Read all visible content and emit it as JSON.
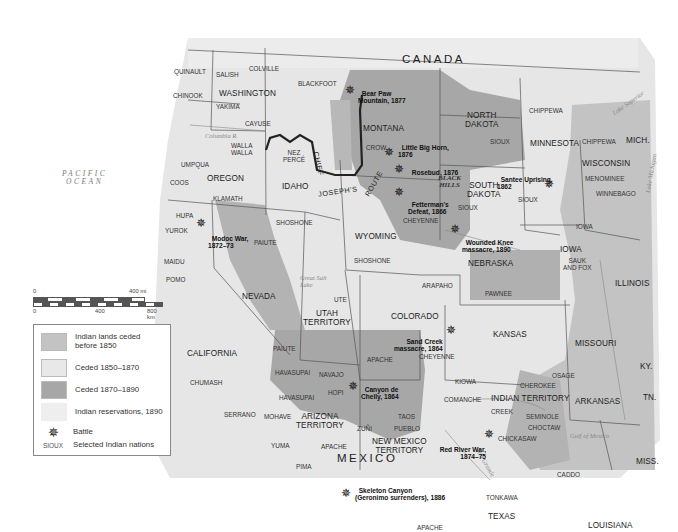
{
  "colors": {
    "ceded_before_1850": "#c3c3c3",
    "ceded_1850_1870": "#e3e3e3",
    "ceded_1870_1890": "#a7a7a7",
    "reservations_1890": "#ededed",
    "background_land": "#e6e6e6",
    "water": "#ffffff",
    "border": "#555555",
    "route": "#222222"
  },
  "countries": {
    "canada": "CANADA",
    "mexico": "MEXICO"
  },
  "water_bodies": {
    "pacific": "PACIFIC\nOCEAN",
    "gulf": "Gulf of Mexico",
    "lake_superior": "Lake Superior",
    "lake_michigan": "Lake Michigan",
    "great_salt_lake": "Great Salt Lake",
    "columbia": "Columbia R.",
    "missouri": "Missouri R.",
    "minnesota_r": "Minnesota R.",
    "platte": "Platte R.",
    "colorado_r": "Colorado R.",
    "arkansas_r": "Arkansas R.",
    "red_r": "Red R.",
    "rio_grande": "Rio Grande",
    "mississippi": "Mississippi R.",
    "snake": "Snake R."
  },
  "states": {
    "washington": "WASHINGTON",
    "oregon": "OREGON",
    "idaho": "IDAHO",
    "montana": "MONTANA",
    "north_dakota": "NORTH\nDAKOTA",
    "south_dakota": "SOUTH\nDAKOTA",
    "minnesota": "MINNESOTA",
    "wisconsin": "WISCONSIN",
    "mich": "MICH.",
    "wyoming": "WYOMING",
    "nebraska": "NEBRASKA",
    "iowa": "IOWA",
    "illinois": "ILLINOIS",
    "nevada": "NEVADA",
    "utah": "UTAH\nTERRITORY",
    "colorado": "COLORADO",
    "kansas": "KANSAS",
    "missouri": "MISSOURI",
    "california": "CALIFORNIA",
    "arizona": "ARIZONA\nTERRITORY",
    "new_mexico": "NEW MEXICO\nTERRITORY",
    "indian_territory": "INDIAN TERRITORY",
    "arkansas": "ARKANSAS",
    "texas": "TEXAS",
    "louisiana": "LOUISIANA",
    "miss": "MISS.",
    "ky": "KY.",
    "tn": "TN."
  },
  "nations": [
    {
      "id": "quinault",
      "label": "QUINAULT"
    },
    {
      "id": "salish",
      "label": "SALISH"
    },
    {
      "id": "colville",
      "label": "COLVILLE"
    },
    {
      "id": "chinook",
      "label": "CHINOOK"
    },
    {
      "id": "yakima",
      "label": "YAKIMA"
    },
    {
      "id": "cayuse",
      "label": "CAYUSE"
    },
    {
      "id": "blackfoot",
      "label": "BLACKFOOT"
    },
    {
      "id": "walla_walla",
      "label": "WALLA\nWALLA"
    },
    {
      "id": "nez_perce",
      "label": "NEZ\nPERCÉ"
    },
    {
      "id": "umpqua",
      "label": "UMPQUA"
    },
    {
      "id": "coos",
      "label": "COOS"
    },
    {
      "id": "klamath",
      "label": "KLAMATH"
    },
    {
      "id": "hupa",
      "label": "HUPA"
    },
    {
      "id": "yurok",
      "label": "YUROK"
    },
    {
      "id": "maidu",
      "label": "MAIDU"
    },
    {
      "id": "pomo",
      "label": "POMO"
    },
    {
      "id": "shoshone_id",
      "label": "SHOSHONE"
    },
    {
      "id": "paiute_n",
      "label": "PAIUTE"
    },
    {
      "id": "crow",
      "label": "CROW"
    },
    {
      "id": "sioux_nd",
      "label": "SIOUX"
    },
    {
      "id": "chippewa_mn",
      "label": "CHIPPEWA"
    },
    {
      "id": "chippewa_wi",
      "label": "CHIPPEWA"
    },
    {
      "id": "menominee",
      "label": "MENOMINEE"
    },
    {
      "id": "winnebago",
      "label": "WINNEBAGO"
    },
    {
      "id": "sioux_sd",
      "label": "SIOUX"
    },
    {
      "id": "sioux_mn",
      "label": "SIOUX"
    },
    {
      "id": "cheyenne_n",
      "label": "CHEYENNE"
    },
    {
      "id": "shoshone_wy",
      "label": "SHOSHONE"
    },
    {
      "id": "iowa_n",
      "label": "IOWA"
    },
    {
      "id": "sauk_fox",
      "label": "SAUK\nAND FOX"
    },
    {
      "id": "ute",
      "label": "UTE"
    },
    {
      "id": "arapaho",
      "label": "ARAPAHO"
    },
    {
      "id": "pawnee",
      "label": "PAWNEE"
    },
    {
      "id": "paiute_s",
      "label": "PAIUTE"
    },
    {
      "id": "apache_co",
      "label": "APACHE"
    },
    {
      "id": "cheyenne_s",
      "label": "CHEYENNE"
    },
    {
      "id": "chumash",
      "label": "CHUMASH"
    },
    {
      "id": "havasupai1",
      "label": "HAVASUPAI"
    },
    {
      "id": "havasupai2",
      "label": "HAVASUPAI"
    },
    {
      "id": "navajo",
      "label": "NAVAJO"
    },
    {
      "id": "hopi",
      "label": "HOPI"
    },
    {
      "id": "kiowa",
      "label": "KIOWA"
    },
    {
      "id": "osage",
      "label": "OSAGE"
    },
    {
      "id": "cherokee",
      "label": "CHEROKEE"
    },
    {
      "id": "comanche",
      "label": "COMANCHE"
    },
    {
      "id": "creek",
      "label": "CREEK"
    },
    {
      "id": "seminole",
      "label": "SEMINOLE"
    },
    {
      "id": "choctaw",
      "label": "CHOCTAW"
    },
    {
      "id": "chickasaw",
      "label": "CHICKASAW"
    },
    {
      "id": "serrano",
      "label": "SERRANO"
    },
    {
      "id": "mohave",
      "label": "MOHAVE"
    },
    {
      "id": "taos",
      "label": "TAOS"
    },
    {
      "id": "pueblo",
      "label": "PUEBLO"
    },
    {
      "id": "zuni",
      "label": "ZUÑI"
    },
    {
      "id": "yuma",
      "label": "YUMA"
    },
    {
      "id": "apache_az",
      "label": "APACHE"
    },
    {
      "id": "pima",
      "label": "PIMA"
    },
    {
      "id": "caddo",
      "label": "CADDO"
    },
    {
      "id": "tonkawa",
      "label": "TONKAWA"
    },
    {
      "id": "apache_tx",
      "label": "APACHE"
    }
  ],
  "battles": [
    {
      "id": "bear_paw",
      "label": "Bear Paw\nMountain, 1877"
    },
    {
      "id": "little_big_horn",
      "label": "Little Big Horn,\n1876"
    },
    {
      "id": "rosebud",
      "label": "Rosebud, 1876"
    },
    {
      "id": "fetterman",
      "label": "Fetterman's\nDefeat, 1866"
    },
    {
      "id": "santee",
      "label": "Santee Uprising,\n1862"
    },
    {
      "id": "wounded_knee",
      "label": "Wounded Knee\nmassacre, 1890"
    },
    {
      "id": "modoc",
      "label": "Modoc War,\n1872–73"
    },
    {
      "id": "sand_creek",
      "label": "Sand Creek\nmassacre, 1864"
    },
    {
      "id": "canyon_de_chelly",
      "label": "Canyon de\nChelly, 1864"
    },
    {
      "id": "red_river",
      "label": "Red River War,\n1874–75"
    },
    {
      "id": "skeleton_canyon",
      "label": "Skeleton Canyon\n(Geronimo surrenders), 1886"
    }
  ],
  "route": {
    "label_1": "CHIEF",
    "label_2": "JOSEPH'S",
    "label_3": "ROUTE"
  },
  "black_hills": "BLACK\nHILLS",
  "scale": {
    "mi_0": "0",
    "mi_400": "400 mi",
    "km_0": "0",
    "km_400": "400",
    "km_800": "800 km"
  },
  "legend": {
    "items": [
      {
        "label": "Indian lands ceded\nbefore 1850",
        "type": "swatch",
        "color_key": "ceded_before_1850"
      },
      {
        "label": "Ceded 1850–1870",
        "type": "swatch",
        "color_key": "ceded_1850_1870"
      },
      {
        "label": "Ceded 1870–1890",
        "type": "swatch",
        "color_key": "ceded_1870_1890"
      },
      {
        "label": "Indian reservations, 1890",
        "type": "swatch",
        "color_key": "reservations_1890"
      },
      {
        "label": "Battle",
        "type": "battle-symbol"
      },
      {
        "label": "Selected Indian nations",
        "type": "nation-sample",
        "sample": "SIOUX"
      }
    ]
  }
}
